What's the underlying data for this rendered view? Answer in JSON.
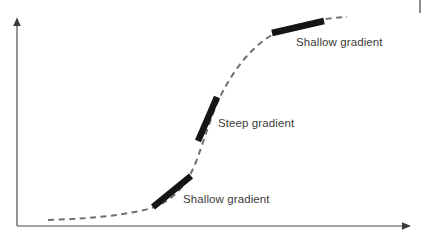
{
  "figure": {
    "type": "line-diagram",
    "title": "",
    "background_color": "#ffffff",
    "width": 426,
    "height": 236
  },
  "axes": {
    "x_axis": {
      "name": "x-axis",
      "label": "",
      "arrow": "right",
      "color": "#4a4a4a",
      "start_px": [
        17,
        226
      ],
      "end_px": [
        410,
        226
      ]
    },
    "y_axis": {
      "name": "y-axis",
      "label": "",
      "arrow": "up",
      "color": "#4a4a4a",
      "start_px": [
        17,
        226
      ],
      "end_px": [
        17,
        19
      ]
    }
  },
  "curve": {
    "name": "sigmoid-curve",
    "style": "dashed",
    "color": "#707070",
    "stroke_width": 2,
    "dash_pattern": "6 4.5",
    "shape": "S-shaped sigmoid rising left to right",
    "path": "M 48 220 C 80 219, 110 217, 140 211 C 165 206, 183 194, 196 162 C 205 138, 212 112, 222 93 C 234 70, 250 48, 272 35 C 296 23, 325 18, 347 17"
  },
  "tangents": [
    {
      "name": "tangent-lower",
      "gradient_type": "shallow",
      "color": "#151515",
      "stroke_width": 6.5,
      "from_px": [
        153,
        207
      ],
      "to_px": [
        191,
        176
      ]
    },
    {
      "name": "tangent-middle",
      "gradient_type": "steep",
      "color": "#151515",
      "stroke_width": 6.5,
      "from_px": [
        198,
        141
      ],
      "to_px": [
        217,
        97
      ]
    },
    {
      "name": "tangent-upper",
      "gradient_type": "shallow",
      "color": "#151515",
      "stroke_width": 6.5,
      "from_px": [
        272,
        33
      ],
      "to_px": [
        324,
        21
      ]
    }
  ],
  "labels": {
    "shallow_lower": "Shallow gradient",
    "steep": "Steep gradient",
    "shallow_upper": "Shallow gradient"
  },
  "artifacts": {
    "right_edge_mark": {
      "name": "scan-edge-mark",
      "color": "#8d8d8d",
      "x": 419,
      "y": 0,
      "width": 2,
      "height": 13
    }
  },
  "colors": {
    "axis": "#4a4a4a",
    "curve": "#707070",
    "tangent": "#151515",
    "text": "#3b3b3b",
    "background": "#ffffff"
  }
}
